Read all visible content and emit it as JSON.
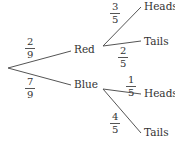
{
  "tree": {
    "first_stage": [
      {
        "label": "Red",
        "probability": {
          "num": "2",
          "den": "9"
        }
      },
      {
        "label": "Blue",
        "probability": {
          "num": "7",
          "den": "9"
        }
      }
    ],
    "second_stage": {
      "red": [
        {
          "label": "Heads",
          "probability": {
            "num": "3",
            "den": "5"
          }
        },
        {
          "label": "Tails",
          "probability": {
            "num": "2",
            "den": "5"
          }
        }
      ],
      "blue": [
        {
          "label": "Heads",
          "probability": {
            "num": "1",
            "den": "5"
          }
        },
        {
          "label": "Tails",
          "probability": {
            "num": "4",
            "den": "5"
          }
        }
      ]
    }
  },
  "colors": {
    "line": "#555555",
    "text": "#333333"
  }
}
